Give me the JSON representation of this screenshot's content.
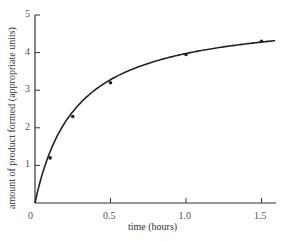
{
  "chart_data": {
    "type": "line",
    "title": "",
    "xlabel": "time (hours)",
    "ylabel": "amount of product formed (appropriate units)",
    "xlim": [
      0,
      1.6
    ],
    "ylim": [
      0,
      5
    ],
    "x_ticks": [
      0,
      0.5,
      1.0,
      1.5
    ],
    "x_tick_labels": [
      "0",
      "0.5",
      "1.0",
      "1.5"
    ],
    "y_ticks": [
      0,
      1,
      2,
      3,
      4,
      5
    ],
    "y_tick_labels": [
      "0",
      "1",
      "2",
      "3",
      "4",
      "5"
    ],
    "grid": false,
    "legend": null,
    "series": [
      {
        "name": "product formed",
        "style": "smooth curve with point markers",
        "x": [
          0.1,
          0.25,
          0.5,
          1.0,
          1.5
        ],
        "values": [
          1.2,
          2.3,
          3.2,
          3.95,
          4.3
        ],
        "curve_starts_at": [
          0,
          0
        ]
      }
    ],
    "colors": {
      "line": "#222222",
      "axis": "#333333",
      "text": "#555555"
    }
  }
}
